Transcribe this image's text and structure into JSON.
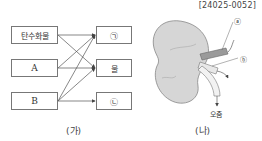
{
  "header": {
    "code": "[24025-0052]"
  },
  "diagram_ga": {
    "caption": "(가)",
    "left_boxes": [
      "탄수화물",
      "A",
      "B"
    ],
    "right_boxes": [
      "㉠",
      "물",
      "㉡"
    ],
    "arrows": [
      {
        "from": "탄수화물",
        "to": "㉠"
      },
      {
        "from": "탄수화물",
        "to": "물"
      },
      {
        "from": "A",
        "to": "㉠"
      },
      {
        "from": "A",
        "to": "물"
      },
      {
        "from": "B",
        "to": "㉠"
      },
      {
        "from": "B",
        "to": "물"
      },
      {
        "from": "B",
        "to": "㉡"
      }
    ]
  },
  "diagram_na": {
    "caption": "(나)",
    "label_a": "ⓐ",
    "label_b": "ⓑ",
    "urine_label": "오줌"
  }
}
